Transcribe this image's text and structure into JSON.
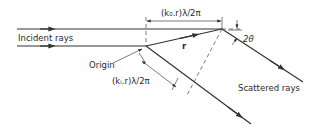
{
  "diagram": {
    "type": "x-ray scattering path difference",
    "labels": {
      "incident": "Incident rays",
      "scattered": "Scattered rays",
      "origin": "Origin",
      "vector": "r",
      "angle": "2θ",
      "path_top": "(k₀.r)λ/2π",
      "path_bottom": "(kᵢ.r)λ/2π"
    },
    "colors": {
      "line": "#333333",
      "text": "#2a2a2a",
      "background": "#ffffff"
    }
  }
}
